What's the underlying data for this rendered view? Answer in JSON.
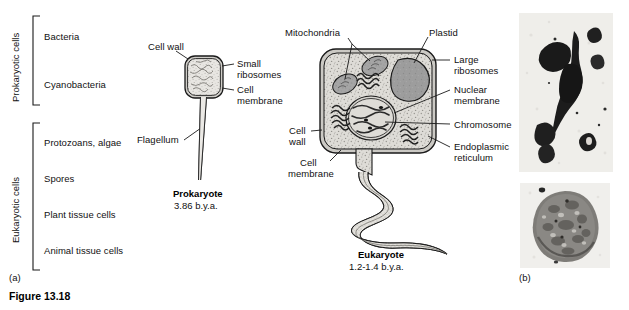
{
  "figure": {
    "caption": "Figure 13.18",
    "panel_a_mark": "(a)",
    "panel_b_mark": "(b)"
  },
  "cell_type_groups": [
    {
      "group_label": "Prokaryotic cells",
      "items": [
        "Bacteria",
        "Cyanobacteria"
      ]
    },
    {
      "group_label": "Eukaryotic cells",
      "items": [
        "Protozoans, algae",
        "Spores",
        "Plant tissue cells",
        "Animal tissue cells"
      ]
    }
  ],
  "prokaryote": {
    "name": "Prokaryote",
    "age": "3.86 b.y.a.",
    "labels": {
      "cell_wall": "Cell wall",
      "small_ribosomes_line1": "Small",
      "small_ribosomes_line2": "ribosomes",
      "cell_membrane_line1": "Cell",
      "cell_membrane_line2": "membrane",
      "flagellum": "Flagellum"
    }
  },
  "eukaryote": {
    "name": "Eukaryote",
    "age": "1.2-1.4  b.y.a.",
    "labels": {
      "mitochondria": "Mitochondria",
      "plastid": "Plastid",
      "large_ribosomes_line1": "Large",
      "large_ribosomes_line2": "ribosomes",
      "nuclear_membrane_line1": "Nuclear",
      "nuclear_membrane_line2": "membrane",
      "chromosome": "Chromosome",
      "endoplasmic_reticulum_line1": "Endoplasmic",
      "endoplasmic_reticulum_line2": "reticulum",
      "cell_wall_line1": "Cell",
      "cell_wall_line2": "wall",
      "cell_membrane_line1": "Cell",
      "cell_membrane_line2": "membrane"
    }
  },
  "micrographs": [
    {
      "name": "filamentous-microfossil-micrograph"
    },
    {
      "name": "spheroidal-microfossil-micrograph"
    }
  ],
  "colors": {
    "ink": "#1a1a1a",
    "cytoplasm": "#d9d7d2",
    "organelle_dark": "#8d8d8d",
    "plastid": "#9a9a9a",
    "nucleus": "#cfcdc8",
    "photo_bg": "#f2f1ee",
    "photo_dark": "#1b1b1b",
    "photo_mid": "#6f6d68"
  }
}
